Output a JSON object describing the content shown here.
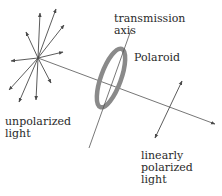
{
  "diagram": {
    "labels": {
      "transmission_axis": "transmission\naxis",
      "polaroid": "Polaroid",
      "unpolarized_light": "unpolarized\nlight",
      "linearly_polarized_light": "linearly\npolarized\nlight"
    },
    "colors": {
      "line": "#555555",
      "polaroid_ring": "#8a8a8a",
      "text": "#2a2a2a"
    },
    "elements": [
      {
        "id": "unpolarized-starburst",
        "kind": "arrow-burst",
        "center": [
          38,
          58
        ],
        "arrow_count": 10
      },
      {
        "id": "beam-line",
        "kind": "line",
        "from": [
          38,
          58
        ],
        "to": [
          217,
          125
        ]
      },
      {
        "id": "polaroid-ring",
        "kind": "ellipse",
        "center": [
          111,
          78
        ]
      },
      {
        "id": "transmission-axis",
        "kind": "line"
      },
      {
        "id": "polarized-arrow",
        "kind": "double-arrow"
      }
    ]
  }
}
